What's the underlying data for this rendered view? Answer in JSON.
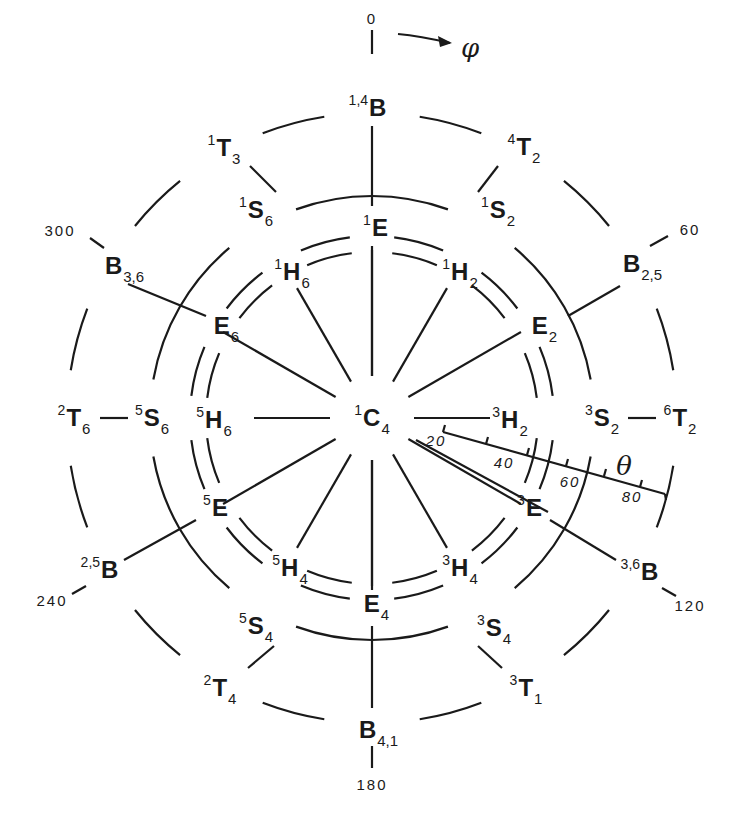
{
  "diagram": {
    "center_label": {
      "sup": "1",
      "base": "C",
      "sub": "4"
    },
    "axis_symbols": {
      "phi": "φ",
      "theta": "θ"
    },
    "phi_ticks": [
      {
        "text": "0",
        "x": 372,
        "y": 18
      },
      {
        "text": "60",
        "x": 690,
        "y": 229
      },
      {
        "text": "120",
        "x": 690,
        "y": 605
      },
      {
        "text": "180",
        "x": 372,
        "y": 784
      },
      {
        "text": "240",
        "x": 52,
        "y": 600
      },
      {
        "text": "300",
        "x": 60,
        "y": 230
      }
    ],
    "theta_ticks": [
      {
        "text": "20",
        "x": 436,
        "y": 440
      },
      {
        "text": "40",
        "x": 504,
        "y": 462
      },
      {
        "text": "60",
        "x": 570,
        "y": 481
      },
      {
        "text": "80",
        "x": 632,
        "y": 496
      }
    ],
    "outer_ring": [
      {
        "sup": "1,4",
        "base": "B",
        "sub": "",
        "x": 368,
        "y": 108
      },
      {
        "sup": "4",
        "base": "T",
        "sub": "2",
        "x": 524,
        "y": 147
      },
      {
        "sup": "",
        "base": "B",
        "sub": "2,5",
        "x": 642,
        "y": 264
      },
      {
        "sup": "6",
        "base": "T",
        "sub": "2",
        "x": 680,
        "y": 418
      },
      {
        "sup": "3,6",
        "base": "B",
        "sub": "",
        "x": 640,
        "y": 572
      },
      {
        "sup": "3",
        "base": "T",
        "sub": "1",
        "x": 526,
        "y": 688
      },
      {
        "sup": "",
        "base": "B",
        "sub": "4,1",
        "x": 378,
        "y": 730
      },
      {
        "sup": "2",
        "base": "T",
        "sub": "4",
        "x": 220,
        "y": 688
      },
      {
        "sup": "2,5",
        "base": "B",
        "sub": "",
        "x": 100,
        "y": 570
      },
      {
        "sup": "2",
        "base": "T",
        "sub": "6",
        "x": 74,
        "y": 418
      },
      {
        "sup": "",
        "base": "B",
        "sub": "3,6",
        "x": 124,
        "y": 266
      },
      {
        "sup": "1",
        "base": "T",
        "sub": "3",
        "x": 224,
        "y": 148
      }
    ],
    "s_ring": [
      {
        "sup": "1",
        "base": "S",
        "sub": "2",
        "x": 498,
        "y": 210
      },
      {
        "sup": "3",
        "base": "S",
        "sub": "2",
        "x": 602,
        "y": 418
      },
      {
        "sup": "3",
        "base": "S",
        "sub": "4",
        "x": 494,
        "y": 628
      },
      {
        "sup": "5",
        "base": "S",
        "sub": "4",
        "x": 256,
        "y": 626
      },
      {
        "sup": "5",
        "base": "S",
        "sub": "6",
        "x": 152,
        "y": 418
      },
      {
        "sup": "1",
        "base": "S",
        "sub": "6",
        "x": 256,
        "y": 210
      }
    ],
    "e_ring": [
      {
        "sup": "1",
        "base": "E",
        "sub": "",
        "x": 376,
        "y": 228
      },
      {
        "sup": "",
        "base": "E",
        "sub": "2",
        "x": 544,
        "y": 326
      },
      {
        "sup": "3",
        "base": "E",
        "sub": "",
        "x": 530,
        "y": 508
      },
      {
        "sup": "",
        "base": "E",
        "sub": "4",
        "x": 376,
        "y": 604
      },
      {
        "sup": "5",
        "base": "E",
        "sub": "",
        "x": 216,
        "y": 508
      },
      {
        "sup": "",
        "base": "E",
        "sub": "6",
        "x": 226,
        "y": 326
      }
    ],
    "h_ring": [
      {
        "sup": "1",
        "base": "H",
        "sub": "2",
        "x": 460,
        "y": 272
      },
      {
        "sup": "3",
        "base": "H",
        "sub": "2",
        "x": 510,
        "y": 420
      },
      {
        "sup": "3",
        "base": "H",
        "sub": "4",
        "x": 460,
        "y": 568
      },
      {
        "sup": "5",
        "base": "H",
        "sub": "4",
        "x": 290,
        "y": 568
      },
      {
        "sup": "5",
        "base": "H",
        "sub": "6",
        "x": 214,
        "y": 420
      },
      {
        "sup": "1",
        "base": "H",
        "sub": "6",
        "x": 292,
        "y": 272
      }
    ]
  }
}
